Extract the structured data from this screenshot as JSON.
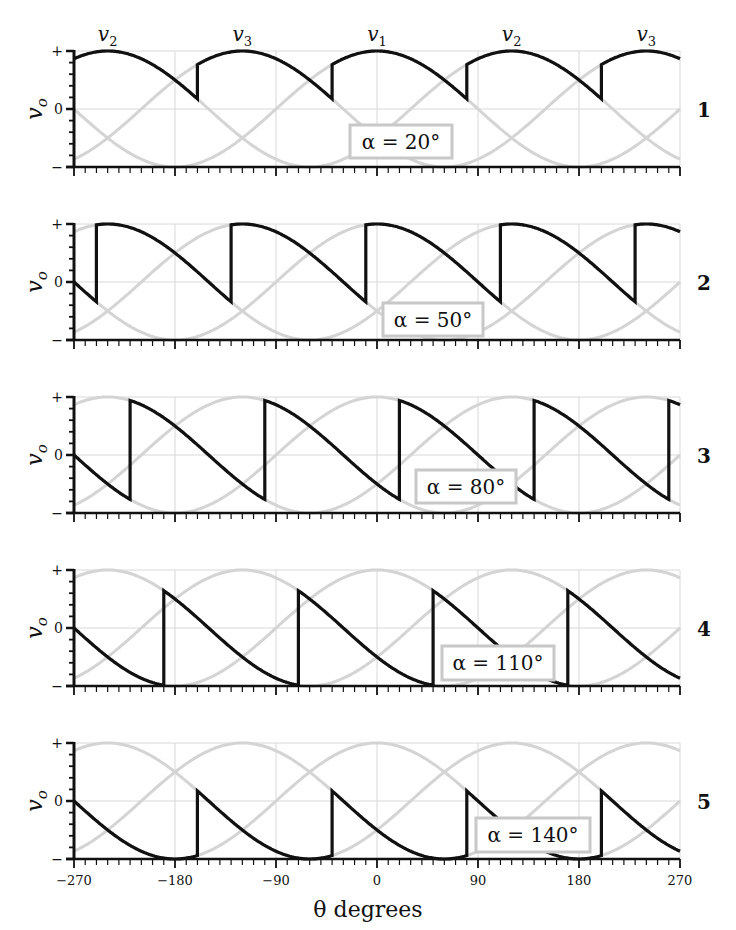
{
  "chart_data": {
    "type": "line",
    "title": "",
    "xlabel": "θ degrees",
    "ylabel": "v_o",
    "xlim": [
      -270,
      270
    ],
    "x_ticks": [
      -270,
      -180,
      -90,
      0,
      90,
      180,
      270
    ],
    "x_tick_labels": [
      "−270",
      "−180",
      "−90",
      "0",
      "90",
      "180",
      "270"
    ],
    "y_tick_labels": [
      "+",
      "0",
      "−"
    ],
    "ylim": [
      -1,
      1
    ],
    "grid": true,
    "phase_labels": [
      {
        "label": "v2",
        "theta": -240
      },
      {
        "label": "v3",
        "theta": -120
      },
      {
        "label": "v1",
        "theta": 0
      },
      {
        "label": "v2",
        "theta": 120
      },
      {
        "label": "v3",
        "theta": 240
      }
    ],
    "background_series": [
      {
        "name": "v1",
        "formula": "cos(θ)"
      },
      {
        "name": "v2",
        "formula": "cos(θ−120°)"
      },
      {
        "name": "v3",
        "formula": "cos(θ+120°)"
      }
    ],
    "panels": [
      {
        "number": "1",
        "alpha_deg": 20,
        "annotation": "α = 20°",
        "series_formula": "v_o = max-phase delayed by α"
      },
      {
        "number": "2",
        "alpha_deg": 50,
        "annotation": "α = 50°",
        "series_formula": "v_o = max-phase delayed by α"
      },
      {
        "number": "3",
        "alpha_deg": 80,
        "annotation": "α = 80°",
        "series_formula": "v_o = max-phase delayed by α"
      },
      {
        "number": "4",
        "alpha_deg": 110,
        "annotation": "α = 110°",
        "series_formula": "v_o = max-phase delayed by α"
      },
      {
        "number": "5",
        "alpha_deg": 140,
        "annotation": "α = 140°",
        "series_formula": "v_o = max-phase delayed by α"
      }
    ]
  },
  "colors": {
    "output_curve": "#111111",
    "phase_curves": "#d4d4d4",
    "grid": "#d8d8d8",
    "axis": "#111111",
    "annotation_box_border": "#c8c8c8"
  },
  "layout": {
    "x_left": 74,
    "x_right": 680,
    "panel_tops": [
      51,
      224,
      397,
      570,
      743
    ],
    "panel_height": 116,
    "annotation_boxes": [
      {
        "x": 350,
        "y": 125,
        "w": 102,
        "h": 33
      },
      {
        "x": 383,
        "y": 303,
        "w": 100,
        "h": 33
      },
      {
        "x": 416,
        "y": 470,
        "w": 100,
        "h": 33
      },
      {
        "x": 442,
        "y": 646,
        "w": 112,
        "h": 34
      },
      {
        "x": 476,
        "y": 818,
        "w": 114,
        "h": 34
      }
    ]
  }
}
